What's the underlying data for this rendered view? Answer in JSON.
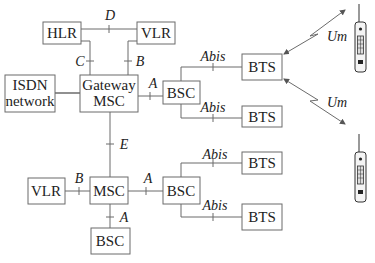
{
  "diagram": {
    "nodes": {
      "hlr": {
        "label": "HLR"
      },
      "vlr_top": {
        "label": "VLR"
      },
      "isdn": {
        "line1": "ISDN",
        "line2": "network"
      },
      "gmsc": {
        "line1": "Gateway",
        "line2": "MSC"
      },
      "bsc_top": {
        "label": "BSC"
      },
      "bts1": {
        "label": "BTS"
      },
      "bts2": {
        "label": "BTS"
      },
      "vlr_bottom": {
        "label": "VLR"
      },
      "msc": {
        "label": "MSC"
      },
      "bsc_right": {
        "label": "BSC"
      },
      "bsc_bottom": {
        "label": "BSC"
      },
      "bts3": {
        "label": "BTS"
      },
      "bts4": {
        "label": "BTS"
      }
    },
    "interfaces": {
      "d": "D",
      "c": "C",
      "b_top": "B",
      "a_top": "A",
      "abis1": "Abis",
      "abis2": "Abis",
      "um1": "Um",
      "um2": "Um",
      "e": "E",
      "b_bottom": "B",
      "a_right": "A",
      "a_bottom": "A",
      "abis3": "Abis",
      "abis4": "Abis"
    },
    "icons": [
      "mobile-phone-icon",
      "mobile-phone-icon"
    ],
    "colors": {
      "stroke": "#6b6b6b",
      "text": "#222222",
      "background": "#ffffff"
    }
  }
}
